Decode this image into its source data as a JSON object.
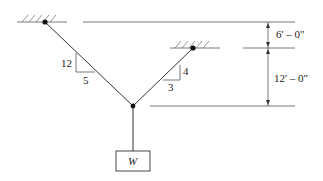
{
  "diagram": {
    "colors": {
      "line": "#333333",
      "thin": "#555555",
      "hatch": "#777777",
      "background": "#ffffff"
    },
    "left_cable": {
      "slope_vertical": "12",
      "slope_horizontal": "5"
    },
    "right_cable": {
      "slope_vertical": "4",
      "slope_horizontal": "3"
    },
    "dimensions": {
      "upper": "6' – 0\"",
      "lower": "12' – 0\""
    },
    "load": {
      "label": "W"
    }
  }
}
